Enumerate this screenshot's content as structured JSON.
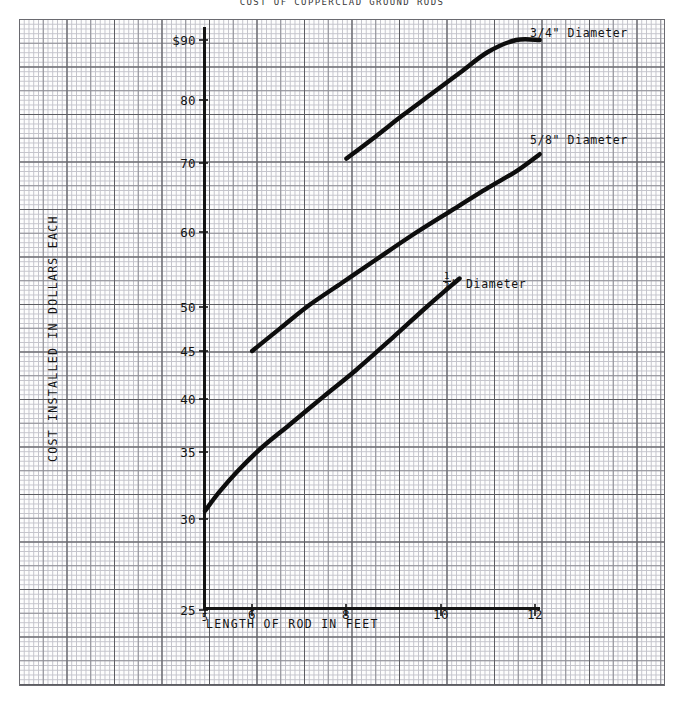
{
  "chart_data": {
    "type": "line",
    "title": "COST OF COPPERCLAD GROUND RODS",
    "xlabel": "LENGTH OF ROD IN FEET",
    "ylabel": "COST INSTALLED IN DOLLARS EACH",
    "xlim": [
      5,
      12.5
    ],
    "ylim": [
      25,
      95
    ],
    "grid": true,
    "legend_position": "inline-right-of-curve",
    "xticks": [
      "5",
      "6",
      "8",
      "10",
      "12"
    ],
    "xtick_values": [
      5,
      6,
      8,
      10,
      12
    ],
    "yticks": [
      "25",
      "30",
      "35",
      "40",
      "45",
      "50",
      "60",
      "70",
      "80",
      "$90"
    ],
    "ytick_values": [
      25,
      30,
      35,
      40,
      45,
      50,
      60,
      70,
      80,
      90
    ],
    "series": [
      {
        "name": "1/2\" Diameter",
        "label_html": "½\" Diameter",
        "x": [
          5.0,
          5.3,
          5.7,
          6.2,
          6.8,
          7.5,
          8.2,
          9.0,
          9.7,
          10.4
        ],
        "y": [
          30.6,
          32.0,
          33.6,
          35.4,
          37.6,
          40.2,
          43.0,
          46.6,
          50.0,
          53.8
        ]
      },
      {
        "name": "5/8\" Diameter",
        "label_html": "5/8\" Diameter",
        "x": [
          6.0,
          6.6,
          7.2,
          7.9,
          8.6,
          9.4,
          10.2,
          11.0,
          11.6,
          12.1
        ],
        "y": [
          45.0,
          47.6,
          50.2,
          53.2,
          56.2,
          59.6,
          63.0,
          66.4,
          68.8,
          71.4
        ]
      },
      {
        "name": "3/4\" Diameter",
        "label_html": "3/4\" Diameter",
        "x": [
          8.0,
          8.6,
          9.2,
          9.8,
          10.4,
          11.0,
          11.6,
          12.1
        ],
        "y": [
          70.7,
          74.1,
          77.6,
          81.0,
          84.5,
          88.0,
          91.5,
          94.6
        ]
      }
    ]
  },
  "axis": {
    "y_axis_name": "vertical-axis-line",
    "x_axis_name": "horizontal-axis-line"
  }
}
